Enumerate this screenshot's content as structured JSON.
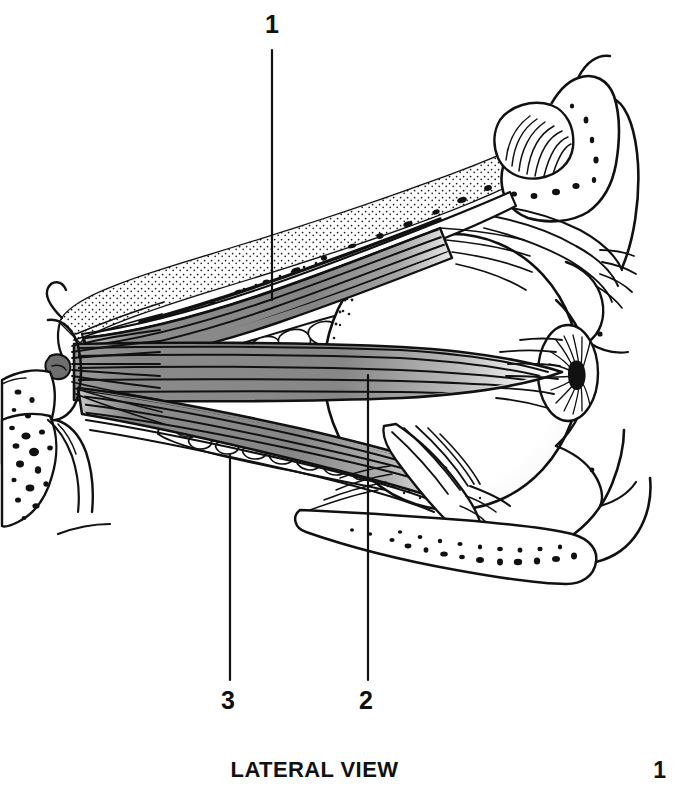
{
  "figure": {
    "caption": "LATERAL VIEW",
    "page_number": "1",
    "style": "black-and-white line drawing",
    "colors": {
      "ink": "#111111",
      "background": "#ffffff",
      "muscle_fill": "#8a8a8a",
      "muscle_fill_light": "#a8a8a8",
      "muscle_fill_dark": "#6e6e6e"
    },
    "labels": [
      {
        "id": "label-1",
        "text": "1",
        "text_x": 272,
        "text_y": 12,
        "leader": {
          "x1": 272,
          "y1": 50,
          "x2": 272,
          "y2": 300
        },
        "points_to": "superior-rectus-levator-complex"
      },
      {
        "id": "label-2",
        "text": "2",
        "text_x": 359,
        "text_y": 688,
        "leader": {
          "x1": 368,
          "y1": 375,
          "x2": 368,
          "y2": 680
        },
        "points_to": "lateral-rectus-muscle"
      },
      {
        "id": "label-3",
        "text": "3",
        "text_x": 221,
        "text_y": 688,
        "leader": {
          "x1": 230,
          "y1": 455,
          "x2": 230,
          "y2": 680
        },
        "points_to": "inferior-rectus-muscle"
      }
    ],
    "structures": [
      "orbital-roof-bone",
      "superior-orbital-rim",
      "lacrimal-gland",
      "levator-palpebrae-superioris",
      "superior-rectus-muscle",
      "orbital-fat-superior",
      "lateral-rectus-muscle",
      "inferior-rectus-muscle",
      "inferior-oblique-muscle",
      "orbital-fat-inferior",
      "globe-eyeball",
      "cornea",
      "iris",
      "pupil",
      "upper-eyelid",
      "lower-eyelid",
      "orbital-apex-annulus-of-zinn",
      "inferior-orbital-rim-bone",
      "cancellous-bone-stippling"
    ]
  }
}
